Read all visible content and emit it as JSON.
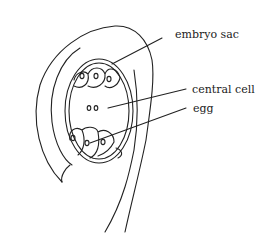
{
  "diagram": {
    "labels": {
      "embryo_sac": "embryo sac",
      "central_cell": "central cell",
      "egg": "egg"
    },
    "colors": {
      "stroke": "#222222",
      "background": "#ffffff"
    }
  }
}
